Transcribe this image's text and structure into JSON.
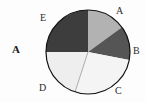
{
  "figure": {
    "label": "A",
    "background_color": "#fdfdfd"
  },
  "chart_data": {
    "type": "pie",
    "title": "",
    "subtitle": "",
    "xlabel": "",
    "ylabel": "",
    "legend_position": "none",
    "grid": false,
    "labels_position": "outside",
    "start_angle_deg": 90,
    "direction": "clockwise",
    "categories": [
      "A",
      "B",
      "C",
      "D",
      "E"
    ],
    "values": [
      15,
      13,
      27,
      20,
      25
    ],
    "unit": "percent",
    "slices": [
      {
        "label": "A",
        "value": 15,
        "sweep_deg": 54,
        "start_deg": 0,
        "end_deg": 54,
        "color": "#b2b2b2",
        "label_x": 116,
        "label_y": 6
      },
      {
        "label": "B",
        "value": 13,
        "sweep_deg": 47,
        "start_deg": 54,
        "end_deg": 101,
        "color": "#555555",
        "label_x": 133,
        "label_y": 46
      },
      {
        "label": "C",
        "value": 27,
        "sweep_deg": 97,
        "start_deg": 101,
        "end_deg": 198,
        "color": "#f4f4f4",
        "label_x": 115,
        "label_y": 86
      },
      {
        "label": "D",
        "value": 20,
        "sweep_deg": 72,
        "start_deg": 198,
        "end_deg": 270,
        "color": "#eeeeee",
        "label_x": 39,
        "label_y": 83
      },
      {
        "label": "E",
        "value": 25,
        "sweep_deg": 90,
        "start_deg": 270,
        "end_deg": 360,
        "color": "#3d3d3d",
        "label_x": 40,
        "label_y": 13
      }
    ],
    "geometry": {
      "center_x": 88,
      "center_y": 52,
      "radius": 42,
      "outline_color": "#111111",
      "outline_width": 1.2,
      "divider_color": "#8c8c8c",
      "divider_width": 0.7
    }
  }
}
